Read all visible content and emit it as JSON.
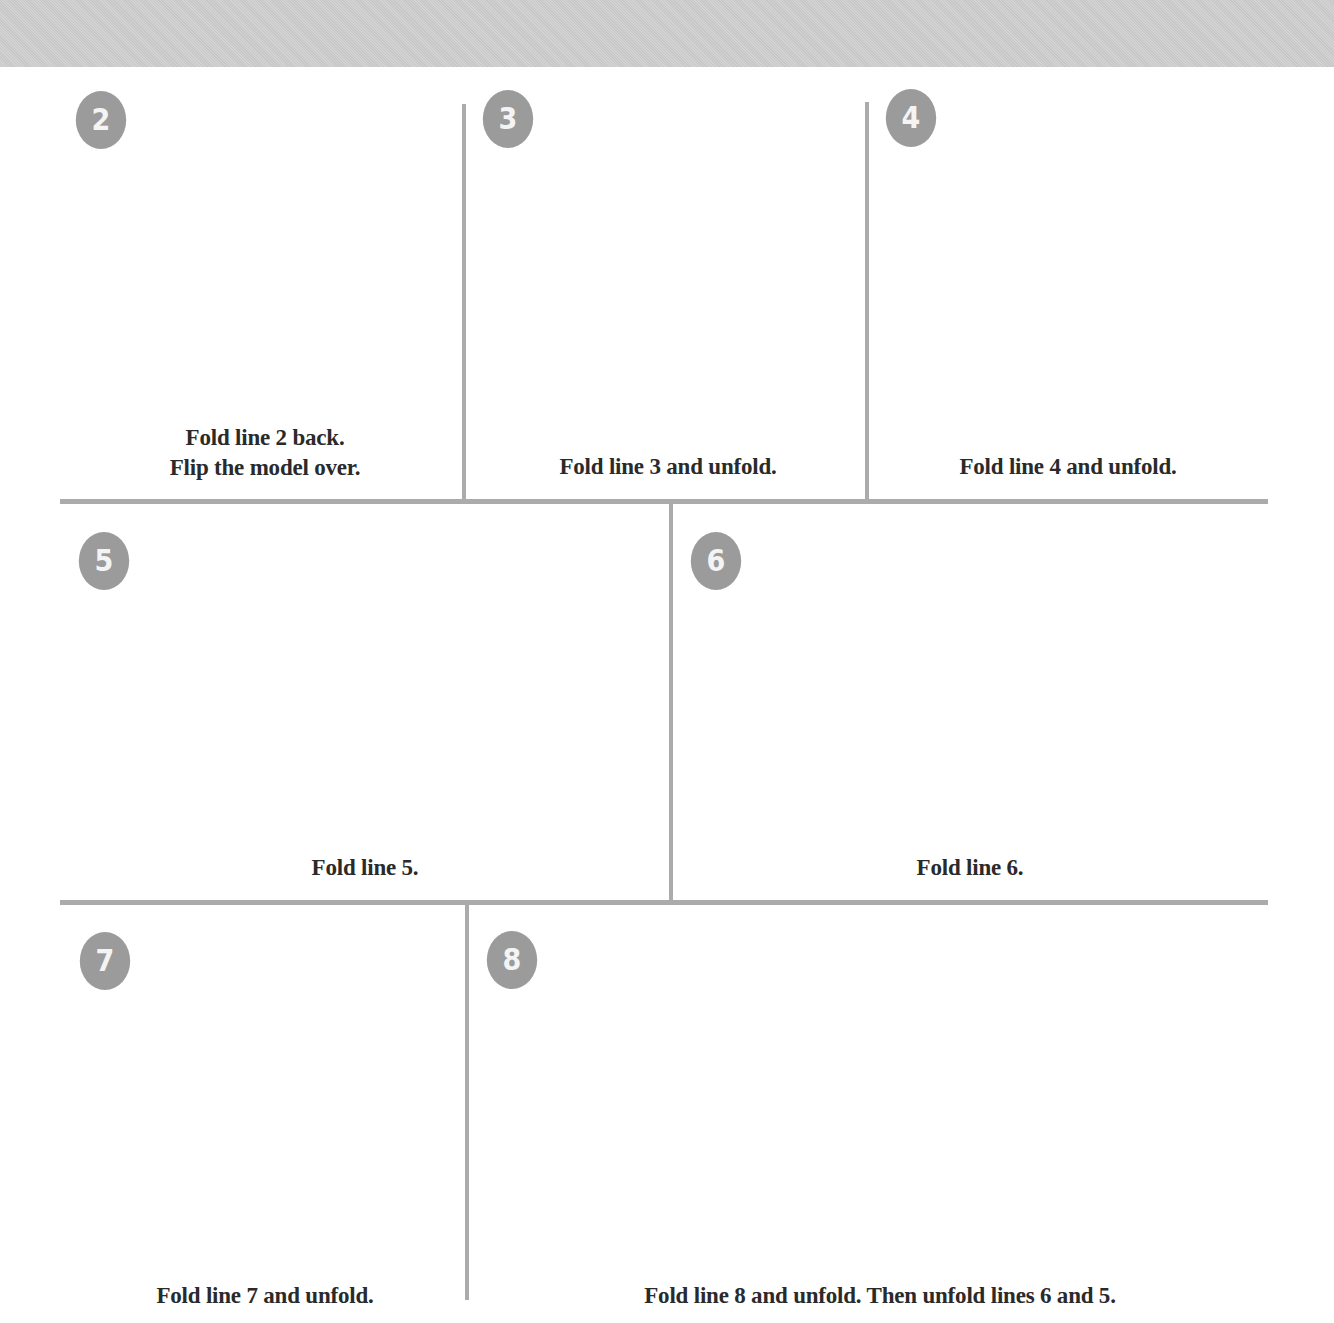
{
  "header": {
    "band_color": "#cfcfcf"
  },
  "colors": {
    "badge": "#9b9b9b",
    "divider": "#ababab",
    "paper_shaded": "#e9e9e9",
    "fold_edge": "#111111",
    "arrow": "#777777",
    "marker_dot": "#606060"
  },
  "steps": [
    {
      "number": "2",
      "caption_lines": [
        "Fold line 2 back.",
        "Flip the model over."
      ],
      "icons": [
        "valley-fold-back-arrow",
        "marker-dot",
        "flip-over-icon"
      ]
    },
    {
      "number": "3",
      "caption_lines": [
        "Fold line 3 and unfold."
      ],
      "icons": [
        "fold-unfold-arrow",
        "dashed-fold-line"
      ]
    },
    {
      "number": "4",
      "caption_lines": [
        "Fold line 4 and unfold."
      ],
      "icons": [
        "fold-unfold-arrow",
        "dashed-fold-line"
      ]
    },
    {
      "number": "5",
      "caption_lines": [
        "Fold line 5."
      ],
      "icons": [
        "fold-arrow",
        "dashed-fold-line"
      ]
    },
    {
      "number": "6",
      "caption_lines": [
        "Fold line 6."
      ],
      "icons": [
        "fold-arrow",
        "dashed-fold-line",
        "marker-dot"
      ]
    },
    {
      "number": "7",
      "caption_lines": [
        "Fold line 7 and unfold."
      ],
      "icons": [
        "fold-arrow",
        "dashed-fold-line",
        "marker-dot"
      ]
    },
    {
      "number": "8",
      "caption_lines": [
        "Fold line 8 and unfold. Then unfold lines 6 and 5."
      ],
      "icons": [
        "fold-arrow",
        "dashed-fold-line",
        "marker-dot"
      ]
    }
  ]
}
